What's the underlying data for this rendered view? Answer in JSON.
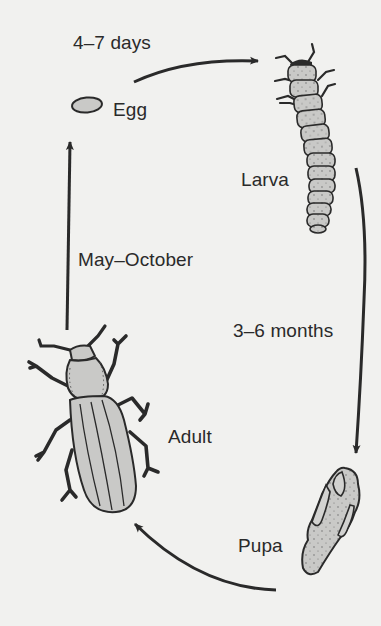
{
  "diagram": {
    "type": "life-cycle",
    "colors": {
      "background": "#f1f1ef",
      "stroke": "#2a2a2a",
      "fill": "#c9c9c7",
      "text": "#2a2a2a"
    },
    "stages": [
      {
        "id": "egg",
        "label": "Egg"
      },
      {
        "id": "larva",
        "label": "Larva"
      },
      {
        "id": "pupa",
        "label": "Pupa"
      },
      {
        "id": "adult",
        "label": "Adult"
      }
    ],
    "transitions": [
      {
        "from": "egg",
        "to": "larva",
        "label": "4–7 days"
      },
      {
        "from": "larva",
        "to": "pupa",
        "label": "3–6 months"
      },
      {
        "from": "pupa",
        "to": "adult",
        "label": ""
      },
      {
        "from": "adult",
        "to": "egg",
        "label": "May–October"
      }
    ]
  }
}
